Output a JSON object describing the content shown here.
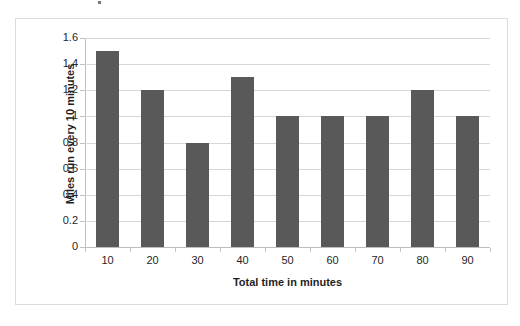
{
  "chart_data": {
    "type": "bar",
    "title": "",
    "xlabel": "Total time in minutes",
    "ylabel": "Miles run every 10 minutes",
    "categories": [
      "10",
      "20",
      "30",
      "40",
      "50",
      "60",
      "70",
      "80",
      "90"
    ],
    "values": [
      1.5,
      1.2,
      0.8,
      1.3,
      1.0,
      1.0,
      1.0,
      1.2,
      1.0
    ],
    "series": [
      {
        "name": "Miles run every 10 minutes",
        "values": [
          1.5,
          1.2,
          0.8,
          1.3,
          1.0,
          1.0,
          1.0,
          1.2,
          1.0
        ]
      }
    ],
    "ylim": [
      0,
      1.6
    ],
    "ytick_labels": [
      "0",
      "0.2",
      "0.4",
      "0.6",
      "0.8",
      "1",
      "1.2",
      "1.4",
      "1.6"
    ],
    "ytick_values": [
      0,
      0.2,
      0.4,
      0.6,
      0.8,
      1,
      1.2,
      1.4,
      1.6
    ],
    "xtick_labels": [
      "10",
      "20",
      "30",
      "40",
      "50",
      "60",
      "70",
      "80",
      "90"
    ],
    "grid": "horizontal",
    "legend": "none",
    "bar_color": "#595959",
    "gridline_color": "#d6d6d6",
    "axis_color": "#bfbfbf",
    "plot_background": "#ffffff",
    "frame_border_color": "#dcdcdc"
  }
}
